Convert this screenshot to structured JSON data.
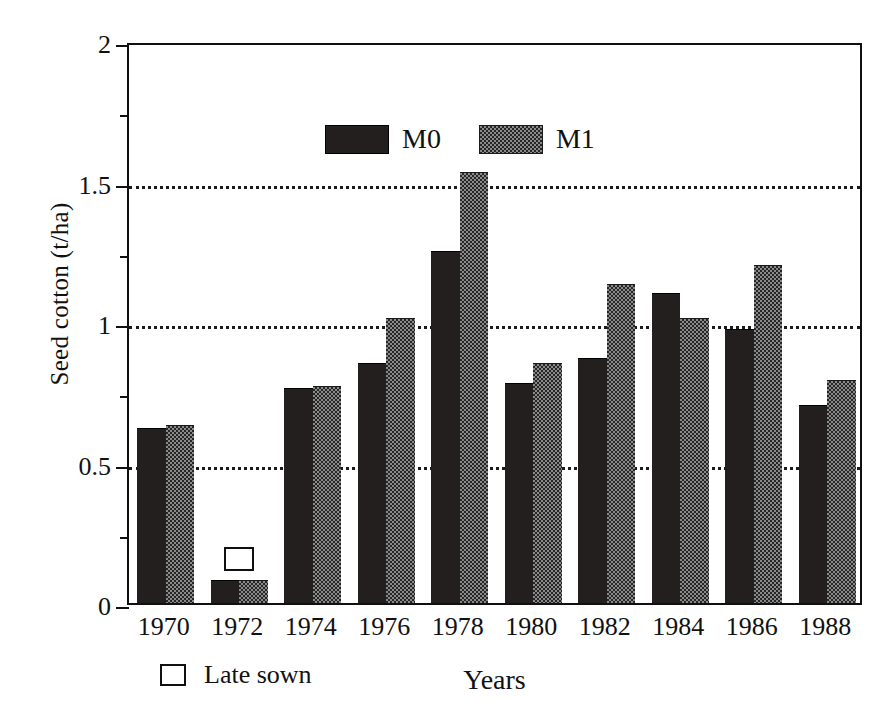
{
  "chart_data": {
    "type": "bar",
    "title": "",
    "xlabel": "Years",
    "ylabel": "Seed cotton (t/ha)",
    "categories": [
      "1970",
      "1972",
      "1974",
      "1976",
      "1978",
      "1980",
      "1982",
      "1984",
      "1986",
      "1988"
    ],
    "series": [
      {
        "name": "M0",
        "values": [
          0.62,
          0.08,
          0.76,
          0.85,
          1.25,
          0.78,
          0.87,
          1.1,
          0.97,
          0.7
        ]
      },
      {
        "name": "M1",
        "values": [
          0.63,
          0.08,
          0.77,
          1.01,
          1.53,
          0.85,
          1.13,
          1.01,
          1.2,
          0.79
        ]
      }
    ],
    "ylim": [
      0,
      2
    ],
    "major_ticks": [
      0,
      0.5,
      1,
      1.5,
      2
    ],
    "minor_ticks": [
      0.25,
      0.75,
      1.25,
      1.75
    ],
    "gridlines": [
      0.5,
      1,
      1.5
    ],
    "grid": true,
    "legend_position": "top-left-inside",
    "annotations": [
      {
        "label": "Late sown",
        "category": "1972",
        "value": 0.22,
        "marker": "open-square"
      }
    ],
    "footnote_legend": {
      "marker": "open-square",
      "label": "Late sown"
    }
  },
  "axes": {
    "y_tick_labels": [
      "0",
      "0.5",
      "1",
      "1.5",
      "2"
    ],
    "x_tick_labels": [
      "1970",
      "1972",
      "1974",
      "1976",
      "1978",
      "1980",
      "1982",
      "1984",
      "1986",
      "1988"
    ],
    "y_title": "Seed cotton (t/ha)",
    "x_title": "Years"
  },
  "legend": {
    "items": [
      {
        "label": "M0",
        "swatch": "dark-solid"
      },
      {
        "label": "M1",
        "swatch": "checkered-gray"
      }
    ]
  },
  "colors": {
    "m0": "#241f1f",
    "m1": "#8a8a8a",
    "axis": "#101010",
    "grid": "#1a1a1a",
    "background": "#ffffff"
  }
}
